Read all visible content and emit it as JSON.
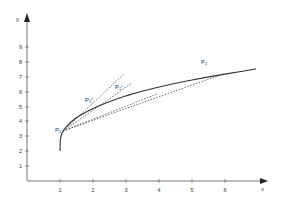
{
  "diagram": {
    "x_axis_label": "x",
    "y_axis_label": "y",
    "x_ticks": [
      "1",
      "2",
      "3",
      "4",
      "5",
      "6"
    ],
    "y_ticks": [
      "1",
      "2",
      "3",
      "4",
      "5",
      "6",
      "7",
      "8",
      "9"
    ],
    "points": [
      {
        "label": "P₁",
        "x": 1.1,
        "y": 3.3
      },
      {
        "label": "P₂ʺ",
        "x": 1.9,
        "y": 5.0
      },
      {
        "label": "P₂ʹ",
        "x": 2.7,
        "y": 5.9
      },
      {
        "label": "P₂",
        "x": 5.4,
        "y": 7.6
      }
    ],
    "curve": "y = 2 + 2.5·sqrt(x-1), x from 1 to 6.9",
    "secants": [
      "P1–P2''",
      "P1–P2'",
      "P1–P2"
    ],
    "tangent_at": "P1"
  }
}
